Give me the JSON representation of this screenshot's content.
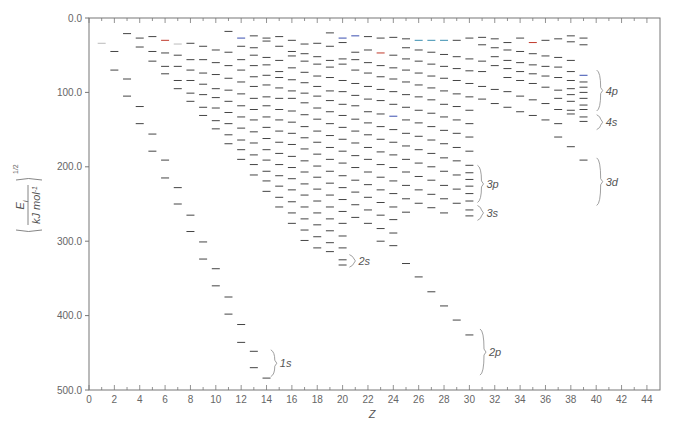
{
  "chart_data": {
    "type": "scatter",
    "marker": "horizontal-dash",
    "title": "",
    "xlabel": "Z",
    "ylabel": "(E_i / kJ mol^-1)^(1/2)",
    "ylabel_parts": {
      "numerator": "E",
      "subscript": "i",
      "denominator": "kJ mol",
      "denominator_sup": "-1",
      "exponent": "1/2"
    },
    "xlim": [
      0,
      45
    ],
    "ylim": [
      0,
      500
    ],
    "y_inverted": true,
    "grid": false,
    "x_ticks": [
      0,
      2,
      4,
      6,
      8,
      10,
      12,
      14,
      16,
      18,
      20,
      22,
      24,
      26,
      28,
      30,
      32,
      34,
      36,
      38,
      40,
      42,
      44
    ],
    "y_ticks": [
      {
        "value": 0,
        "label": "0.0"
      },
      {
        "value": 100,
        "label": "100.0"
      },
      {
        "value": 200,
        "label": "200.0"
      },
      {
        "value": 300,
        "label": "300.0"
      },
      {
        "value": 400,
        "label": "400.0"
      },
      {
        "value": 500,
        "label": "500.0"
      }
    ],
    "shell_annotations": [
      {
        "label": "1s",
        "z": 14.1,
        "y_from": 446,
        "y_to": 482
      },
      {
        "label": "2s",
        "z": 20.3,
        "y_from": 318,
        "y_to": 335
      },
      {
        "label": "2p",
        "z": 30.6,
        "y_from": 418,
        "y_to": 480
      },
      {
        "label": "3p",
        "z": 30.4,
        "y_from": 198,
        "y_to": 248
      },
      {
        "label": "3s",
        "z": 30.4,
        "y_from": 252,
        "y_to": 272
      },
      {
        "label": "4p",
        "z": 39.8,
        "y_from": 70,
        "y_to": 125
      },
      {
        "label": "4s",
        "z": 39.8,
        "y_from": 130,
        "y_to": 150
      },
      {
        "label": "3d",
        "z": 39.8,
        "y_from": 188,
        "y_to": 252
      }
    ],
    "levels": [
      {
        "z": 1,
        "values": [
          34
        ]
      },
      {
        "z": 2,
        "values": [
          45,
          70
        ]
      },
      {
        "z": 3,
        "values": [
          21,
          82,
          105
        ]
      },
      {
        "z": 4,
        "values": [
          27,
          39,
          119,
          142
        ]
      },
      {
        "z": 5,
        "values": [
          25,
          45,
          58,
          156,
          179
        ]
      },
      {
        "z": 6,
        "values": [
          30,
          47,
          65,
          75,
          191,
          215
        ]
      },
      {
        "z": 7,
        "values": [
          35,
          50,
          65,
          84,
          95,
          228,
          250
        ]
      },
      {
        "z": 8,
        "values": [
          34,
          56,
          70,
          84,
          101,
          112,
          265,
          287
        ]
      },
      {
        "z": 9,
        "values": [
          38,
          56,
          74,
          89,
          103,
          120,
          131,
          301,
          324
        ]
      },
      {
        "z": 10,
        "values": [
          43,
          60,
          76,
          95,
          107,
          121,
          138,
          149,
          337,
          360
        ]
      },
      {
        "z": 11,
        "values": [
          18,
          46,
          64,
          81,
          97,
          112,
          127,
          142,
          157,
          169,
          375,
          398
        ]
      },
      {
        "z": 12,
        "values": [
          27,
          38,
          56,
          70,
          86,
          102,
          118,
          133,
          148,
          164,
          177,
          190,
          412,
          436
        ]
      },
      {
        "z": 13,
        "values": [
          24,
          40,
          50,
          64,
          79,
          92,
          108,
          123,
          137,
          153,
          168,
          184,
          197,
          211,
          448,
          470
        ]
      },
      {
        "z": 14,
        "values": [
          27,
          31,
          53,
          63,
          77,
          90,
          106,
          118,
          133,
          147,
          162,
          177,
          191,
          206,
          219,
          233,
          484
        ]
      },
      {
        "z": 15,
        "values": [
          25,
          38,
          57,
          72,
          80,
          94,
          108,
          123,
          137,
          152,
          167,
          182,
          197,
          212,
          226,
          241,
          254
        ]
      },
      {
        "z": 16,
        "values": [
          30,
          45,
          51,
          67,
          83,
          98,
          108,
          125,
          140,
          155,
          170,
          186,
          201,
          216,
          231,
          247,
          262,
          276
        ]
      },
      {
        "z": 17,
        "values": [
          35,
          48,
          58,
          73,
          87,
          101,
          114,
          130,
          146,
          161,
          176,
          192,
          207,
          223,
          238,
          254,
          270,
          285,
          299
        ]
      },
      {
        "z": 18,
        "values": [
          34,
          52,
          62,
          78,
          92,
          105,
          121,
          136,
          152,
          167,
          183,
          199,
          214,
          230,
          246,
          262,
          278,
          294,
          309
        ]
      },
      {
        "z": 19,
        "values": [
          20,
          38,
          57,
          66,
          80,
          98,
          111,
          126,
          142,
          158,
          174,
          190,
          206,
          222,
          238,
          254,
          270,
          286,
          302,
          314
        ]
      },
      {
        "z": 20,
        "values": [
          27,
          33,
          55,
          62,
          84,
          99,
          116,
          131,
          147,
          163,
          179,
          195,
          212,
          228,
          244,
          260,
          276,
          293,
          309,
          325,
          332
        ]
      },
      {
        "z": 21,
        "values": [
          24,
          46,
          56,
          70,
          88,
          104,
          118,
          136,
          152,
          168,
          185,
          201,
          218,
          234,
          251,
          268
        ]
      },
      {
        "z": 22,
        "values": [
          25,
          43,
          60,
          74,
          92,
          109,
          126,
          141,
          157,
          174,
          190,
          207,
          224,
          241,
          258,
          276
        ]
      },
      {
        "z": 23,
        "values": [
          27,
          47,
          64,
          79,
          96,
          111,
          129,
          146,
          163,
          180,
          197,
          214,
          231,
          248,
          265,
          283,
          300
        ]
      },
      {
        "z": 24,
        "values": [
          26,
          50,
          67,
          82,
          99,
          116,
          132,
          150,
          167,
          184,
          201,
          219,
          236,
          254,
          271,
          289,
          306
        ]
      },
      {
        "z": 25,
        "values": [
          28,
          40,
          55,
          70,
          86,
          103,
          120,
          137,
          155,
          172,
          190,
          207,
          225,
          243,
          261,
          330
        ]
      },
      {
        "z": 26,
        "values": [
          30,
          43,
          58,
          74,
          90,
          106,
          124,
          141,
          159,
          177,
          195,
          213,
          231,
          249,
          348
        ]
      },
      {
        "z": 27,
        "values": [
          30,
          46,
          62,
          78,
          94,
          110,
          128,
          146,
          164,
          182,
          200,
          218,
          237,
          255,
          368
        ]
      },
      {
        "z": 28,
        "values": [
          30,
          49,
          65,
          81,
          98,
          116,
          133,
          151,
          169,
          188,
          206,
          225,
          243,
          262,
          387
        ]
      },
      {
        "z": 29,
        "values": [
          30,
          52,
          68,
          84,
          102,
          119,
          137,
          155,
          174,
          192,
          211,
          230,
          249,
          406
        ]
      },
      {
        "z": 30,
        "values": [
          27,
          55,
          71,
          88,
          106,
          124,
          142,
          160,
          179,
          198,
          208,
          217,
          226,
          236,
          246,
          258,
          266,
          426
        ]
      },
      {
        "z": 31,
        "values": [
          26,
          36,
          58,
          72,
          92,
          109
        ]
      },
      {
        "z": 32,
        "values": [
          28,
          40,
          52,
          64,
          96,
          115
        ]
      },
      {
        "z": 33,
        "values": [
          33,
          43,
          57,
          68,
          80,
          99,
          120
        ]
      },
      {
        "z": 34,
        "values": [
          27,
          45,
          60,
          72,
          84,
          105,
          126
        ]
      },
      {
        "z": 35,
        "values": [
          33,
          48,
          63,
          75,
          88,
          110,
          131
        ]
      },
      {
        "z": 36,
        "values": [
          30,
          51,
          65,
          78,
          93,
          115,
          137
        ]
      },
      {
        "z": 37,
        "values": [
          28,
          53,
          66,
          80,
          97,
          108,
          123,
          142,
          160
        ]
      },
      {
        "z": 38,
        "values": [
          24,
          32,
          57,
          72,
          84,
          95,
          103,
          112,
          124,
          129,
          173
        ]
      },
      {
        "z": 39,
        "values": [
          27,
          36,
          77,
          86,
          93,
          100,
          108,
          117,
          123,
          133,
          139,
          191
        ]
      }
    ],
    "highlight_colors": {
      "dash": "#444444",
      "red_dash": "#c0392b",
      "blue_dash": "#3a4fb0",
      "faint_dash": "#bbbbbb"
    },
    "colored_dashes": [
      {
        "z": 1,
        "value": 34,
        "color": "#bbbbbb"
      },
      {
        "z": 6,
        "value": 30,
        "color": "#c0392b"
      },
      {
        "z": 7,
        "value": 35,
        "color": "#bbbbbb"
      },
      {
        "z": 12,
        "value": 27,
        "color": "#3a4fb0"
      },
      {
        "z": 20,
        "value": 27,
        "color": "#3a4fb0"
      },
      {
        "z": 21,
        "value": 24,
        "color": "#3a4fb0"
      },
      {
        "z": 23,
        "value": 47,
        "color": "#c0392b"
      },
      {
        "z": 26,
        "value": 30,
        "color": "#3a8fb0"
      },
      {
        "z": 27,
        "value": 30,
        "color": "#3a8fb0"
      },
      {
        "z": 28,
        "value": 30,
        "color": "#3a8fb0"
      },
      {
        "z": 24,
        "value": 132,
        "color": "#3a4fb0"
      },
      {
        "z": 35,
        "value": 33,
        "color": "#c0392b"
      },
      {
        "z": 39,
        "value": 77,
        "color": "#3a4fb0"
      }
    ]
  },
  "axes": {
    "x_title": "Z",
    "y_title": "(E_i / kJ mol^-1)^(1/2)"
  }
}
